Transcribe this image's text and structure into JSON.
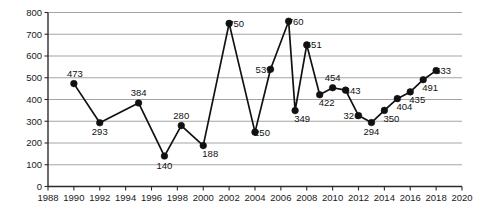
{
  "chart_data": {
    "type": "line",
    "title": "",
    "subtitle": "",
    "xlabel": "",
    "ylabel": "",
    "grid": true,
    "legend": null,
    "xlim": [
      1988,
      2020
    ],
    "ylim": [
      0,
      800
    ],
    "y_ticks": [
      0,
      100,
      200,
      300,
      400,
      500,
      600,
      700,
      800
    ],
    "x_ticks": [
      1988,
      1990,
      1992,
      1994,
      1996,
      1998,
      2000,
      2002,
      2004,
      2006,
      2008,
      2010,
      2012,
      2014,
      2016,
      2018,
      2020
    ],
    "x_tick_labels": [
      "1988",
      "1990",
      "1992",
      "1994",
      "1996",
      "1998",
      "2000",
      "2002",
      "2004",
      "2006",
      "2008",
      "2010",
      "2012",
      "2014",
      "2016",
      "2018",
      "2020"
    ],
    "y_tick_labels": [
      "0",
      "100",
      "200",
      "300",
      "400",
      "500",
      "600",
      "700",
      "800"
    ],
    "series": [
      {
        "name": "series-1",
        "color": "#111111",
        "marker": "circle",
        "x": [
          1990.0,
          1992.0,
          1995.0,
          1997.0,
          1998.3,
          2000.0,
          2002.0,
          2004.0,
          2005.2,
          2006.6,
          2007.1,
          2008.0,
          2009.0,
          2010.0,
          2011.0,
          2012.0,
          2013.0,
          2014.0,
          2015.0,
          2016.0,
          2017.0,
          2018.0
        ],
        "values": [
          473,
          293,
          384,
          140,
          280,
          188,
          750,
          250,
          539,
          760,
          349,
          651,
          422,
          454,
          443,
          326,
          294,
          350,
          404,
          435,
          491,
          533
        ],
        "point_labels": [
          "473",
          "293",
          "384",
          "140",
          "280",
          "188",
          "750",
          "250",
          "539",
          "760",
          "349",
          "651",
          "422",
          "454",
          "443",
          "326",
          "294",
          "350",
          "404",
          "435",
          "491",
          "533"
        ],
        "label_positions": [
          "above-left",
          "below",
          "above",
          "below",
          "above",
          "below-right",
          "right",
          "right",
          "left",
          "right",
          "below-right",
          "right",
          "below-right",
          "above",
          "right",
          "left",
          "below",
          "below-right",
          "below-right",
          "below-right",
          "below-right",
          "right"
        ]
      }
    ]
  }
}
